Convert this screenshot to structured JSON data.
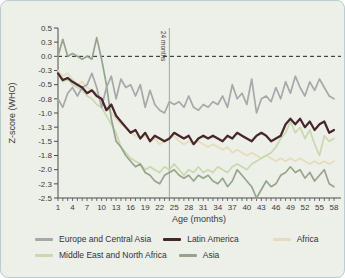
{
  "figure": {
    "title": "",
    "panel_bg": "#edefe9",
    "panel_border": "#bccdd1"
  },
  "chart_data": {
    "type": "line",
    "xlabel": "Age (months)",
    "ylabel": "Z-score (WHO)",
    "xlim": [
      1,
      58
    ],
    "ylim": [
      -2.5,
      0.5
    ],
    "grid": false,
    "legend_position": "bottom",
    "zero_line": {
      "y": 0,
      "style": "dashed",
      "color": "#1f1f1f"
    },
    "annotation_vline": {
      "x": 24,
      "label": "24 months",
      "color": "#9fab9c"
    },
    "xticks": [
      1,
      4,
      7,
      10,
      13,
      16,
      19,
      22,
      25,
      28,
      31,
      34,
      37,
      40,
      43,
      46,
      49,
      52,
      55,
      58
    ],
    "ytick_labels": [
      "0.5",
      "0.3",
      "0.0",
      "-0.3",
      "-0.5",
      "-0.8",
      "-1.0",
      "-1.3",
      "-1.5",
      "-1.8",
      "-2.0",
      "-2.3",
      "-2.5"
    ],
    "ytick_values": [
      0.5,
      0.25,
      0,
      -0.25,
      -0.5,
      -0.75,
      -1,
      -1.25,
      -1.5,
      -1.75,
      -2,
      -2.25,
      -2.5
    ],
    "x_months": [
      1,
      2,
      3,
      4,
      5,
      6,
      7,
      8,
      9,
      10,
      11,
      12,
      13,
      14,
      15,
      16,
      17,
      18,
      19,
      20,
      21,
      22,
      23,
      24,
      25,
      26,
      27,
      28,
      29,
      30,
      31,
      32,
      33,
      34,
      35,
      36,
      37,
      38,
      39,
      40,
      41,
      42,
      43,
      44,
      45,
      46,
      47,
      48,
      49,
      50,
      51,
      52,
      53,
      54,
      55,
      56,
      57,
      58
    ],
    "series": [
      {
        "name": "Europe and Central Asia",
        "color": "#a6a8aa",
        "width": 1.7,
        "values": [
          -0.75,
          -0.9,
          -0.65,
          -0.55,
          -0.7,
          -0.55,
          -0.5,
          -0.3,
          -0.55,
          -0.9,
          -0.55,
          -0.35,
          -0.75,
          -0.4,
          -0.55,
          -0.5,
          -0.7,
          -0.5,
          -0.9,
          -0.6,
          -0.85,
          -0.95,
          -1.0,
          -0.8,
          -0.85,
          -0.8,
          -0.9,
          -0.7,
          -0.9,
          -0.95,
          -0.85,
          -0.9,
          -0.8,
          -0.85,
          -0.7,
          -0.9,
          -0.5,
          -0.75,
          -0.65,
          -0.85,
          -0.4,
          -1.0,
          -0.75,
          -0.7,
          -0.8,
          -0.55,
          -0.75,
          -0.45,
          -0.65,
          -0.35,
          -0.55,
          -0.7,
          -0.45,
          -0.6,
          -0.4,
          -0.55,
          -0.7,
          -0.75
        ]
      },
      {
        "name": "Latin America",
        "color": "#46262a",
        "width": 2.2,
        "values": [
          -0.3,
          -0.42,
          -0.38,
          -0.45,
          -0.5,
          -0.55,
          -0.65,
          -0.6,
          -0.7,
          -0.75,
          -0.95,
          -0.85,
          -1.05,
          -1.15,
          -1.25,
          -1.35,
          -1.3,
          -1.45,
          -1.35,
          -1.5,
          -1.4,
          -1.45,
          -1.5,
          -1.45,
          -1.35,
          -1.4,
          -1.45,
          -1.4,
          -1.55,
          -1.45,
          -1.4,
          -1.45,
          -1.4,
          -1.45,
          -1.5,
          -1.4,
          -1.45,
          -1.35,
          -1.4,
          -1.45,
          -1.5,
          -1.4,
          -1.35,
          -1.4,
          -1.5,
          -1.45,
          -1.4,
          -1.2,
          -1.1,
          -1.2,
          -1.1,
          -1.25,
          -1.15,
          -1.3,
          -1.2,
          -1.15,
          -1.35,
          -1.3
        ]
      },
      {
        "name": "Africa",
        "color": "#e3ddbc",
        "width": 1.7,
        "values": [
          -0.25,
          -0.35,
          -0.3,
          -0.4,
          -0.5,
          -0.45,
          -0.55,
          -0.6,
          -0.65,
          -0.8,
          -0.9,
          -1.0,
          -1.1,
          -1.2,
          -1.25,
          -1.35,
          -1.4,
          -1.45,
          -1.4,
          -1.5,
          -1.45,
          -1.55,
          -1.5,
          -1.45,
          -1.4,
          -1.5,
          -1.55,
          -1.5,
          -1.55,
          -1.5,
          -1.55,
          -1.6,
          -1.55,
          -1.6,
          -1.65,
          -1.6,
          -1.7,
          -1.65,
          -1.7,
          -1.75,
          -1.7,
          -1.75,
          -1.8,
          -1.75,
          -1.8,
          -1.85,
          -1.8,
          -1.85,
          -1.8,
          -1.85,
          -1.8,
          -1.85,
          -1.9,
          -1.85,
          -1.9,
          -1.85,
          -1.9,
          -1.85
        ]
      },
      {
        "name": "Middle East and North Africa",
        "color": "#c9d8ae",
        "width": 1.7,
        "values": [
          -0.3,
          -0.45,
          -0.4,
          -0.5,
          -0.55,
          -0.6,
          -0.7,
          -0.75,
          -0.85,
          -0.9,
          -1.05,
          -1.2,
          -1.35,
          -1.6,
          -1.7,
          -1.8,
          -1.85,
          -1.9,
          -2.0,
          -1.95,
          -2.0,
          -2.05,
          -1.95,
          -2.0,
          -1.9,
          -2.0,
          -2.1,
          -2.0,
          -2.05,
          -1.95,
          -2.05,
          -2.0,
          -2.05,
          -1.95,
          -2.0,
          -2.05,
          -1.95,
          -1.9,
          -1.95,
          -2.0,
          -1.9,
          -1.85,
          -1.8,
          -1.75,
          -1.7,
          -1.6,
          -1.45,
          -1.35,
          -1.15,
          -1.35,
          -1.25,
          -1.45,
          -1.3,
          -1.55,
          -1.75,
          -1.4,
          -1.5,
          -1.45
        ]
      },
      {
        "name": "Asia",
        "color": "#97a48c",
        "width": 1.7,
        "values": [
          0.0,
          0.3,
          0.0,
          0.05,
          0.0,
          -0.05,
          0.0,
          -0.05,
          0.33,
          -0.05,
          -0.5,
          -1.1,
          -1.5,
          -1.6,
          -1.75,
          -1.85,
          -1.95,
          -1.9,
          -2.05,
          -2.1,
          -2.2,
          -2.25,
          -2.1,
          -2.05,
          -2.0,
          -2.1,
          -2.15,
          -2.1,
          -2.2,
          -2.1,
          -2.15,
          -2.1,
          -2.2,
          -2.25,
          -2.15,
          -2.3,
          -2.2,
          -2.0,
          -2.1,
          -2.2,
          -2.3,
          -2.5,
          -2.35,
          -2.2,
          -2.3,
          -2.25,
          -2.1,
          -2.05,
          -1.95,
          -2.05,
          -2.0,
          -2.15,
          -2.05,
          -2.2,
          -2.1,
          -2.0,
          -2.25,
          -2.3
        ]
      }
    ],
    "legend_rows": [
      [
        0,
        1,
        2
      ],
      [
        3,
        4
      ]
    ],
    "draw_order": [
      2,
      3,
      4,
      0,
      1
    ]
  }
}
